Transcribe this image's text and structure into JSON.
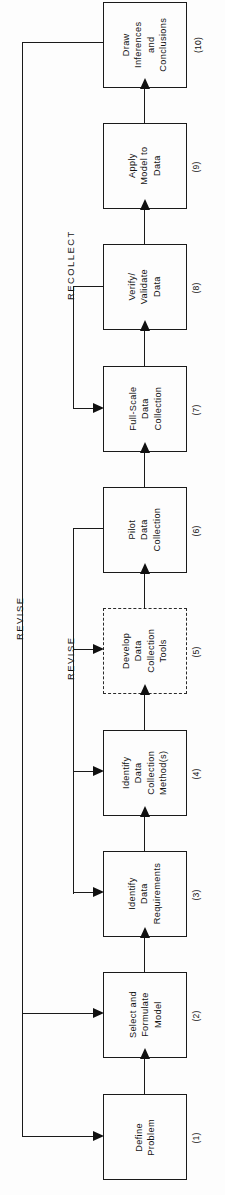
{
  "figure": {
    "kind": "flowchart",
    "orientation": "rotated-90-counterclockwise",
    "background_color": "#fdfdfd",
    "line_color": "#1a1a1a"
  },
  "steps": [
    {
      "id": "step-1",
      "number": "(1)",
      "label": "Define\nProblem",
      "style": "solid"
    },
    {
      "id": "step-2",
      "number": "(2)",
      "label": "Select and\nFormulate\nModel",
      "style": "solid"
    },
    {
      "id": "step-3",
      "number": "(3)",
      "label": "Identify\nData\nRequirements",
      "style": "solid"
    },
    {
      "id": "step-4",
      "number": "(4)",
      "label": "Identify\nData\nCollection\nMethod(s)",
      "style": "solid"
    },
    {
      "id": "step-5",
      "number": "(5)",
      "label": "Develop\nData\nCollection\nTools",
      "style": "dashed"
    },
    {
      "id": "step-6",
      "number": "(6)",
      "label": "Pilot\nData\nCollection",
      "style": "solid"
    },
    {
      "id": "step-7",
      "number": "(7)",
      "label": "Full-Scale\nData\nCollection",
      "style": "solid"
    },
    {
      "id": "step-8",
      "number": "(8)",
      "label": "Verify/\nValidate\nData",
      "style": "solid"
    },
    {
      "id": "step-9",
      "number": "(9)",
      "label": "Apply\nModel to\nData",
      "style": "solid"
    },
    {
      "id": "step-10",
      "number": "(10)",
      "label": "Draw\nInferences\nand\nConclusions",
      "style": "solid"
    }
  ],
  "loops": [
    {
      "id": "loop-revise-outer",
      "label": "REVISE",
      "from": "step-10",
      "to": [
        "step-2",
        "step-1"
      ]
    },
    {
      "id": "loop-revise-inner",
      "label": "REVISE",
      "from": "step-6",
      "to": [
        "step-5",
        "step-4",
        "step-3"
      ]
    },
    {
      "id": "loop-recollect",
      "label": "RECOLLECT",
      "from": "step-8",
      "to": [
        "step-7"
      ]
    }
  ],
  "flow_sequence": [
    "step-1",
    "step-2",
    "step-3",
    "step-4",
    "step-5",
    "step-6",
    "step-7",
    "step-8",
    "step-9",
    "step-10"
  ]
}
